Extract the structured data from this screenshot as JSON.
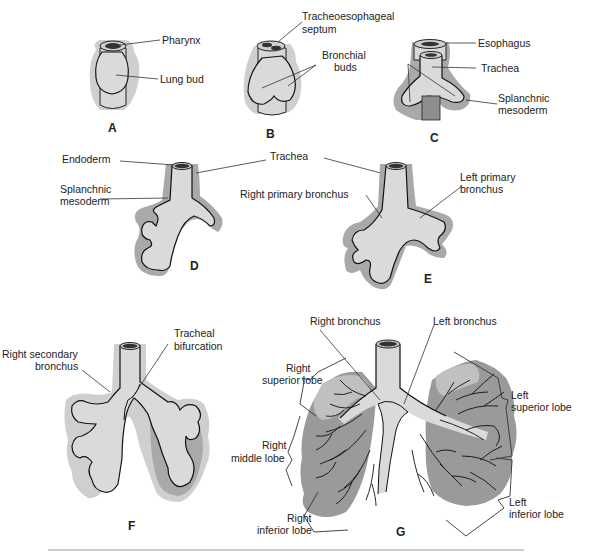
{
  "figure": {
    "panels": [
      {
        "id": "A",
        "labels": [
          "Pharynx",
          "Lung bud"
        ]
      },
      {
        "id": "B",
        "labels": [
          "Tracheoesophageal septum",
          "Bronchial buds"
        ]
      },
      {
        "id": "C",
        "labels": [
          "Esophagus",
          "Trachea",
          "Splanchnic mesoderm"
        ]
      },
      {
        "id": "D",
        "labels": [
          "Endoderm",
          "Splanchnic mesoderm"
        ]
      },
      {
        "id": "E",
        "labels": [
          "Trachea",
          "Right primary bronchus",
          "Left primary bronchus"
        ]
      },
      {
        "id": "F",
        "labels": [
          "Right secondary bronchus",
          "Tracheal bifurcation"
        ]
      },
      {
        "id": "G",
        "labels": [
          "Right bronchus",
          "Left bronchus",
          "Right superior lobe",
          "Right middle lobe",
          "Right inferior lobe",
          "Left superior lobe",
          "Left inferior lobe"
        ]
      }
    ]
  },
  "labels": {
    "pharynx": "Pharynx",
    "lung_bud": "Lung bud",
    "te_septum_1": "Tracheoesophageal",
    "te_septum_2": "septum",
    "bronchial_buds_1": "Bronchial",
    "bronchial_buds_2": "buds",
    "esophagus": "Esophagus",
    "trachea_c": "Trachea",
    "splanchnic_c_1": "Splanchnic",
    "splanchnic_c_2": "mesoderm",
    "endoderm": "Endoderm",
    "trachea_de": "Trachea",
    "splanchnic_d_1": "Splanchnic",
    "splanchnic_d_2": "mesoderm",
    "right_primary_bronchus": "Right primary bronchus",
    "left_primary_bronchus_1": "Left primary",
    "left_primary_bronchus_2": "bronchus",
    "tracheal_bifurcation_1": "Tracheal",
    "tracheal_bifurcation_2": "bifurcation",
    "right_secondary_bronchus_1": "Right secondary",
    "right_secondary_bronchus_2": "bronchus",
    "right_bronchus": "Right bronchus",
    "left_bronchus": "Left bronchus",
    "right_superior_lobe_1": "Right",
    "right_superior_lobe_2": "superior lobe",
    "right_middle_lobe_1": "Right",
    "right_middle_lobe_2": "middle lobe",
    "right_inferior_lobe_1": "Right",
    "right_inferior_lobe_2": "inferior lobe",
    "left_superior_lobe_1": "Left",
    "left_superior_lobe_2": "superior lobe",
    "left_inferior_lobe_1": "Left",
    "left_inferior_lobe_2": "inferior lobe"
  },
  "panel_letters": {
    "A": "A",
    "B": "B",
    "C": "C",
    "D": "D",
    "E": "E",
    "F": "F",
    "G": "G"
  }
}
